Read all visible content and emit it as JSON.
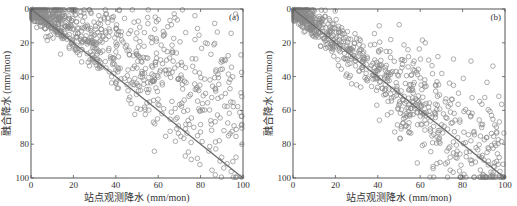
{
  "chart_data": [
    {
      "id": "a",
      "type": "scatter",
      "panel_label": "(a)",
      "xlabel": "站点观测降水 (mm/mon)",
      "ylabel": "融合降水 (mm/mon)",
      "xlim": [
        0,
        100
      ],
      "ylim": [
        0,
        100
      ],
      "y_inverted": true,
      "xticks": [
        0,
        20,
        40,
        60,
        80,
        100
      ],
      "yticks": [
        0,
        20,
        40,
        60,
        80,
        100
      ],
      "grid": false,
      "reference_line": {
        "type": "1:1",
        "from": [
          0,
          0
        ],
        "to": [
          100,
          100
        ]
      },
      "marker": "open-circle",
      "marker_color": "#8a8a8a",
      "line_color": "#6a6a6a",
      "description": "Fused precipitation largely underestimates station observations; points cluster above 1:1 line (smaller fused values) with wide spread",
      "seed": 17,
      "n_points": 900,
      "dist": {
        "mode": "under",
        "slope": 0.55,
        "spread": 0.45
      }
    },
    {
      "id": "b",
      "type": "scatter",
      "panel_label": "(b)",
      "xlabel": "站点观测降水 (mm/mon)",
      "ylabel": "融合降水 (mm/mon)",
      "xlim": [
        0,
        100
      ],
      "ylim": [
        0,
        100
      ],
      "y_inverted": true,
      "xticks": [
        0,
        20,
        40,
        60,
        80,
        100
      ],
      "yticks": [
        0,
        20,
        40,
        60,
        80,
        100
      ],
      "grid": false,
      "reference_line": {
        "type": "1:1",
        "from": [
          0,
          0
        ],
        "to": [
          100,
          100
        ]
      },
      "marker": "open-circle",
      "marker_color": "#8a8a8a",
      "line_color": "#6a6a6a",
      "description": "Fused precipitation closely follows station observations along the 1:1 line with moderate scatter",
      "seed": 29,
      "n_points": 900,
      "dist": {
        "mode": "near",
        "slope": 0.95,
        "spread": 0.2
      }
    }
  ]
}
